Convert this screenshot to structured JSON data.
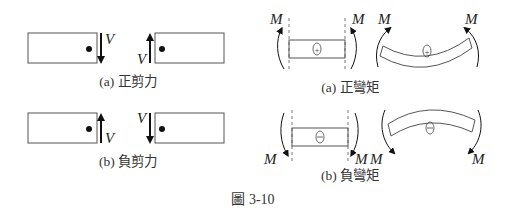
{
  "figure": {
    "caption": "圖 3-10",
    "shear": {
      "positive": {
        "caption": "(a) 正剪力",
        "left_label": "V",
        "right_label": "V",
        "left_arrow_direction": "down",
        "right_arrow_direction": "up"
      },
      "negative": {
        "caption": "(b) 負剪力",
        "left_label": "V",
        "right_label": "V",
        "left_arrow_direction": "up",
        "right_arrow_direction": "down"
      }
    },
    "moment": {
      "positive": {
        "caption": "(a) 正彎矩",
        "labels": [
          "M",
          "M",
          "M",
          "M"
        ],
        "sign_symbol": "+",
        "curvature": "concave-up"
      },
      "negative": {
        "caption": "(b) 負彎矩",
        "labels": [
          "M",
          "M",
          "M",
          "M"
        ],
        "sign_symbol": "−",
        "curvature": "concave-down"
      }
    }
  }
}
